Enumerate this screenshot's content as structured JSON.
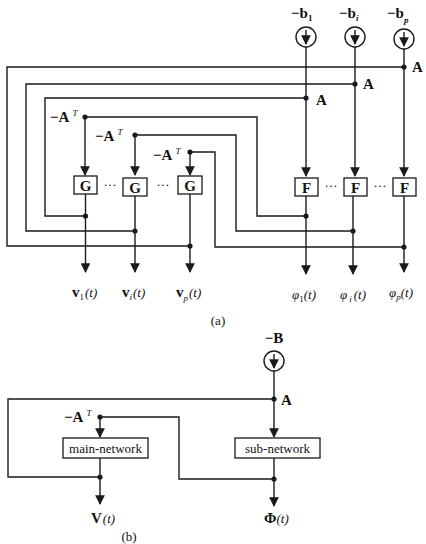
{
  "diagram_a": {
    "caption": "(a)",
    "sources": [
      {
        "label": "−b",
        "sub": "1",
        "icon": "current-source-icon"
      },
      {
        "label": "−b",
        "sub": "i",
        "icon": "current-source-icon"
      },
      {
        "label": "−b",
        "sub": "p",
        "icon": "current-source-icon"
      }
    ],
    "a_labels": [
      "A",
      "A",
      "A"
    ],
    "neg_at_labels": [
      {
        "base": "−A",
        "sup": "T"
      },
      {
        "base": "−A",
        "sup": "T"
      },
      {
        "base": "−A",
        "sup": "T"
      }
    ],
    "g_blocks": [
      "G",
      "G",
      "G"
    ],
    "f_blocks": [
      "F",
      "F",
      "F"
    ],
    "ellipsis": "···",
    "v_outputs": [
      {
        "base": "v",
        "sub": "1",
        "arg": "(t)"
      },
      {
        "base": "v",
        "sub": "i",
        "arg": "(t)"
      },
      {
        "base": "v",
        "sub": "p",
        "arg": "(t)"
      }
    ],
    "phi_outputs": [
      {
        "base": "φ",
        "sub": "1",
        "arg": "(t)"
      },
      {
        "base": "φ",
        "sub": "i",
        "arg": "(t)"
      },
      {
        "base": "φ",
        "sub": "p",
        "arg": "(t)"
      }
    ]
  },
  "diagram_b": {
    "caption": "(b)",
    "source": {
      "label": "−B",
      "icon": "current-source-icon"
    },
    "a_label": "A",
    "neg_at_label": {
      "base": "−A",
      "sup": "T"
    },
    "main_block": "main-network",
    "sub_block": "sub-network",
    "v_output": {
      "base": "V",
      "arg": "(t)"
    },
    "phi_output": {
      "base": "Φ",
      "arg": "(t)"
    }
  }
}
